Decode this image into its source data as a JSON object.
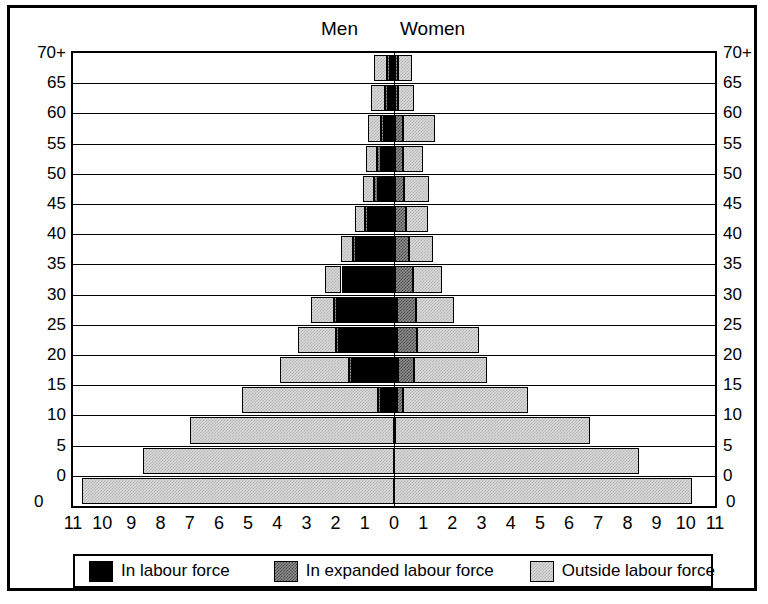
{
  "header": {
    "men": "Men",
    "women": "Women"
  },
  "legend": {
    "items": [
      {
        "key": "in",
        "label": "In labour force",
        "swatch": "black-swatch",
        "color": "#000000"
      },
      {
        "key": "exp",
        "label": "In expanded labour force",
        "swatch": "dark-gray-swatch",
        "color": "#8e8e8e"
      },
      {
        "key": "out",
        "label": "Outside labour force",
        "swatch": "light-gray-swatch",
        "color": "#d8d8d8"
      }
    ]
  },
  "axes": {
    "x_ticks_left": [
      "11",
      "10",
      "9",
      "8",
      "7",
      "6",
      "5",
      "4",
      "3",
      "2",
      "1",
      "0"
    ],
    "x_ticks_right": [
      "1",
      "2",
      "3",
      "4",
      "5",
      "6",
      "7",
      "8",
      "9",
      "10",
      "11"
    ],
    "x_zero_left": "0",
    "x_zero_right": "0",
    "y_ticks": [
      "70+",
      "65",
      "60",
      "55",
      "50",
      "45",
      "40",
      "35",
      "30",
      "25",
      "20",
      "15",
      "10",
      "5",
      "0"
    ],
    "xlim": [
      -11,
      11
    ],
    "x_unit_step": 1
  },
  "chart_data": {
    "type": "bar",
    "title": "",
    "subtitle": "",
    "xlabel": "",
    "ylabel": "",
    "orientation": "horizontal-population-pyramid",
    "grid": true,
    "legend_position": "bottom",
    "xlim": [
      -11,
      11
    ],
    "categories": [
      "0",
      "5",
      "10",
      "15",
      "20",
      "25",
      "30",
      "35",
      "40",
      "45",
      "50",
      "55",
      "60",
      "65",
      "70+"
    ],
    "stack_order": [
      "in_labour_force",
      "in_expanded_labour_force",
      "outside_labour_force"
    ],
    "series": [
      {
        "name": "Men",
        "side": "left",
        "stacks": [
          {
            "category": "0",
            "in_labour_force": 0.0,
            "in_expanded_labour_force": 0.0,
            "outside_labour_force": 10.7
          },
          {
            "category": "5",
            "in_labour_force": 0.0,
            "in_expanded_labour_force": 0.0,
            "outside_labour_force": 8.6
          },
          {
            "category": "10",
            "in_labour_force": 0.0,
            "in_expanded_labour_force": 0.0,
            "outside_labour_force": 7.0
          },
          {
            "category": "15",
            "in_labour_force": 0.45,
            "in_expanded_labour_force": 0.1,
            "outside_labour_force": 4.65
          },
          {
            "category": "20",
            "in_labour_force": 1.45,
            "in_expanded_labour_force": 0.1,
            "outside_labour_force": 2.35
          },
          {
            "category": "25",
            "in_labour_force": 1.9,
            "in_expanded_labour_force": 0.1,
            "outside_labour_force": 1.3
          },
          {
            "category": "30",
            "in_labour_force": 1.95,
            "in_expanded_labour_force": 0.1,
            "outside_labour_force": 0.8
          },
          {
            "category": "35",
            "in_labour_force": 1.7,
            "in_expanded_labour_force": 0.1,
            "outside_labour_force": 0.55
          },
          {
            "category": "40",
            "in_labour_force": 1.3,
            "in_expanded_labour_force": 0.1,
            "outside_labour_force": 0.4
          },
          {
            "category": "45",
            "in_labour_force": 0.9,
            "in_expanded_labour_force": 0.1,
            "outside_labour_force": 0.35
          },
          {
            "category": "50",
            "in_labour_force": 0.55,
            "in_expanded_labour_force": 0.15,
            "outside_labour_force": 0.35
          },
          {
            "category": "55",
            "in_labour_force": 0.45,
            "in_expanded_labour_force": 0.15,
            "outside_labour_force": 0.35
          },
          {
            "category": "60",
            "in_labour_force": 0.35,
            "in_expanded_labour_force": 0.1,
            "outside_labour_force": 0.45
          },
          {
            "category": "65",
            "in_labour_force": 0.2,
            "in_expanded_labour_force": 0.1,
            "outside_labour_force": 0.5
          },
          {
            "category": "70+",
            "in_labour_force": 0.15,
            "in_expanded_labour_force": 0.08,
            "outside_labour_force": 0.45
          }
        ]
      },
      {
        "name": "Women",
        "side": "right",
        "stacks": [
          {
            "category": "0",
            "in_labour_force": 0.0,
            "in_expanded_labour_force": 0.0,
            "outside_labour_force": 10.2
          },
          {
            "category": "5",
            "in_labour_force": 0.0,
            "in_expanded_labour_force": 0.0,
            "outside_labour_force": 8.4
          },
          {
            "category": "10",
            "in_labour_force": 0.0,
            "in_expanded_labour_force": 0.05,
            "outside_labour_force": 6.65
          },
          {
            "category": "15",
            "in_labour_force": 0.1,
            "in_expanded_labour_force": 0.2,
            "outside_labour_force": 4.3
          },
          {
            "category": "20",
            "in_labour_force": 0.15,
            "in_expanded_labour_force": 0.55,
            "outside_labour_force": 2.5
          },
          {
            "category": "25",
            "in_labour_force": 0.1,
            "in_expanded_labour_force": 0.7,
            "outside_labour_force": 2.1
          },
          {
            "category": "30",
            "in_labour_force": 0.1,
            "in_expanded_labour_force": 0.65,
            "outside_labour_force": 1.3
          },
          {
            "category": "35",
            "in_labour_force": 0.05,
            "in_expanded_labour_force": 0.6,
            "outside_labour_force": 1.0
          },
          {
            "category": "40",
            "in_labour_force": 0.05,
            "in_expanded_labour_force": 0.45,
            "outside_labour_force": 0.85
          },
          {
            "category": "45",
            "in_labour_force": 0.05,
            "in_expanded_labour_force": 0.35,
            "outside_labour_force": 0.75
          },
          {
            "category": "50",
            "in_labour_force": 0.05,
            "in_expanded_labour_force": 0.3,
            "outside_labour_force": 0.85
          },
          {
            "category": "55",
            "in_labour_force": 0.05,
            "in_expanded_labour_force": 0.25,
            "outside_labour_force": 0.7
          },
          {
            "category": "60",
            "in_labour_force": 0.05,
            "in_expanded_labour_force": 0.25,
            "outside_labour_force": 1.1
          },
          {
            "category": "65",
            "in_labour_force": 0.03,
            "in_expanded_labour_force": 0.12,
            "outside_labour_force": 0.55
          },
          {
            "category": "70+",
            "in_labour_force": 0.03,
            "in_expanded_labour_force": 0.1,
            "outside_labour_force": 0.5
          }
        ]
      }
    ]
  }
}
